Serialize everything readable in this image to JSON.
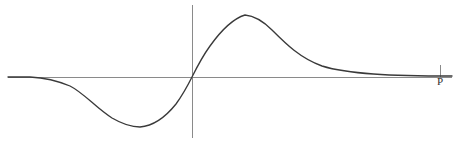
{
  "figure": {
    "width": 455,
    "height": 143,
    "background": "#ffffff",
    "axis_color": "#8a8a8a",
    "curve_color": "#3a3a3a",
    "label_color": "#2e2e2e"
  },
  "axes": {
    "x_axis": {
      "name": "horizontal-axis",
      "y": 77,
      "x_start": 8,
      "x_end": 452,
      "label": "P"
    },
    "y_axis": {
      "name": "vertical-axis",
      "x": 192,
      "y_start": 5,
      "y_end": 138,
      "label": ""
    },
    "tick": {
      "name": "x-axis-tick",
      "x": 440,
      "y_top": 65,
      "y_bottom": 77
    }
  },
  "chart_data": {
    "type": "line",
    "title": "",
    "subtitle": "",
    "xlabel": "P",
    "ylabel": "",
    "grid": false,
    "legend": null,
    "annotations": [],
    "axis_origin_px": {
      "x": 192,
      "y": 77
    },
    "xlim_px": [
      8,
      452
    ],
    "ylim_px": [
      5,
      138
    ],
    "key_points_px": [
      {
        "label": "left-baseline-start",
        "x": 8,
        "y": 77
      },
      {
        "label": "left-baseline-end",
        "x": 48,
        "y": 78
      },
      {
        "label": "trough-minimum",
        "x": 137,
        "y": 127
      },
      {
        "label": "zero-crossing",
        "x": 192,
        "y": 77
      },
      {
        "label": "peak-maximum",
        "x": 245,
        "y": 15
      },
      {
        "label": "decay-inflection",
        "x": 300,
        "y": 38
      },
      {
        "label": "right-baseline-approach",
        "x": 400,
        "y": 72
      },
      {
        "label": "right-baseline-end",
        "x": 452,
        "y": 76
      }
    ],
    "x": [
      8,
      20,
      35,
      48,
      60,
      72,
      85,
      95,
      105,
      115,
      125,
      137,
      150,
      162,
      172,
      182,
      192,
      202,
      212,
      222,
      232,
      245,
      258,
      270,
      282,
      295,
      310,
      325,
      340,
      355,
      370,
      385,
      400,
      415,
      430,
      452
    ],
    "y": [
      77,
      77,
      78,
      79,
      81,
      85,
      92,
      100,
      109,
      117,
      123,
      127,
      126,
      120,
      111,
      96,
      77,
      58,
      42,
      28,
      19,
      15,
      16,
      20,
      26,
      33,
      41,
      48,
      55,
      60,
      64,
      68,
      72,
      74,
      75,
      76
    ],
    "path_d": "M 8 77 L 30 77 C 48 78 58 81 70 86 C 84 93 96 108 112 118 C 124 125 132 127 140 127 C 152 126 164 119 176 104 C 184 93 188 85 192 77 C 197 67 202 57 210 46 C 220 32 232 19 245 15 C 256 16 264 22 272 30 C 286 44 300 58 322 66 C 348 74 390 76 452 76"
  },
  "labels": {
    "x_axis_label": "P"
  }
}
